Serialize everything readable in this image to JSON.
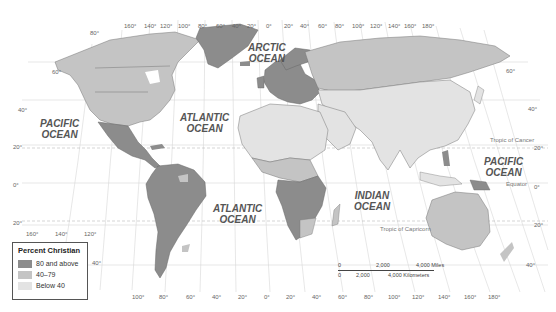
{
  "map": {
    "theme": "Percent Christian",
    "colors": {
      "high": "#8c8c8c",
      "mid": "#c4c4c4",
      "low": "#e3e3e3",
      "border": "#666666",
      "grid": "#cfcfcf",
      "water": "#ffffff"
    }
  },
  "legend": {
    "title": "Percent Christian",
    "items": [
      {
        "label": "80 and above",
        "color": "#8c8c8c"
      },
      {
        "label": "40–79",
        "color": "#c4c4c4"
      },
      {
        "label": "Below 40",
        "color": "#e3e3e3"
      }
    ]
  },
  "oceans": {
    "arctic": [
      "ARCTIC",
      "OCEAN"
    ],
    "atlantic_north": [
      "ATLANTIC",
      "OCEAN"
    ],
    "atlantic_south": [
      "ATLANTIC",
      "OCEAN"
    ],
    "pacific_west": [
      "PACIFIC",
      "OCEAN"
    ],
    "pacific_east": [
      "PACIFIC",
      "OCEAN"
    ],
    "indian": [
      "INDIAN",
      "OCEAN"
    ]
  },
  "lines": {
    "tropic_cancer": "Tropic of Cancer",
    "equator": "Equator",
    "tropic_capricorn": "Tropic of Capricorn"
  },
  "grid_labels": {
    "top_longitudes": [
      "160°",
      "140°",
      "120°",
      "100°",
      "80°",
      "60°",
      "40°",
      "20°",
      "0°",
      "20°",
      "40°",
      "60°",
      "80°",
      "100°",
      "120°",
      "140°",
      "160°",
      "180°"
    ],
    "bottom_longitudes": [
      "100°",
      "80°",
      "60°",
      "40°",
      "20°",
      "0°",
      "20°",
      "40°",
      "60°",
      "80°",
      "100°",
      "120°",
      "140°",
      "160°",
      "180°"
    ],
    "left_left_mid": [
      "160°",
      "140°",
      "120°"
    ],
    "left_latitudes": [
      "80°",
      "60°",
      "40°",
      "20°",
      "0°",
      "20°",
      "40°"
    ],
    "right_latitudes": [
      "60°",
      "40°",
      "20°",
      "0°",
      "20°",
      "40°"
    ]
  },
  "scale": {
    "miles": [
      "0",
      "2,000",
      "4,000 Miles"
    ],
    "km": [
      "0",
      "2,000",
      "4,000 Kilometers"
    ]
  }
}
